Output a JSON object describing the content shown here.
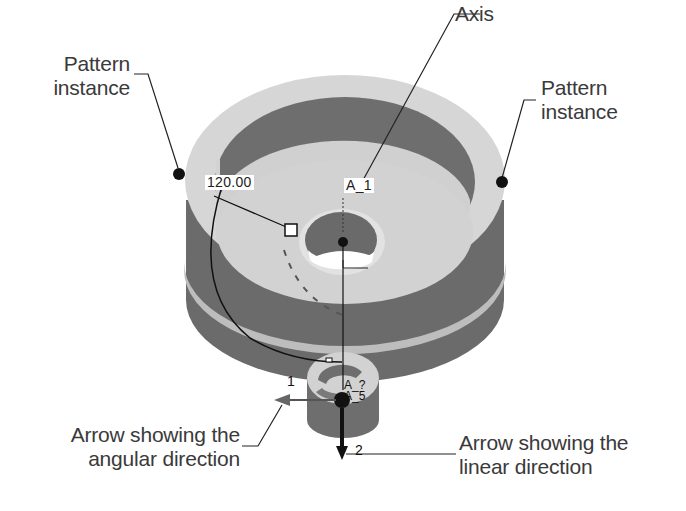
{
  "figure": {
    "colors": {
      "background": "#ffffff",
      "light_face": "#d4d4d4",
      "dark_face": "#6b6b6b",
      "mid_face": "#9a9a9a",
      "text": "#3a3a3a",
      "leader": "#222222"
    }
  },
  "callouts": {
    "pattern_instance_left": "Pattern instance",
    "pattern_instance_left_l1": "Pattern",
    "pattern_instance_left_l2": "instance",
    "axis": "Axis",
    "pattern_instance_right_l1": "Pattern",
    "pattern_instance_right_l2": "instance",
    "angular_arrow_l1": "Arrow showing the",
    "angular_arrow_l2": "angular direction",
    "linear_arrow_l1": "Arrow showing the",
    "linear_arrow_l2": "linear direction"
  },
  "annotations": {
    "angle_dimension": "120.00",
    "axis_label": "A_1",
    "feature_axis_top": "A_?",
    "feature_axis_bottom": "A_5",
    "direction_1": "1",
    "direction_2": "2"
  }
}
